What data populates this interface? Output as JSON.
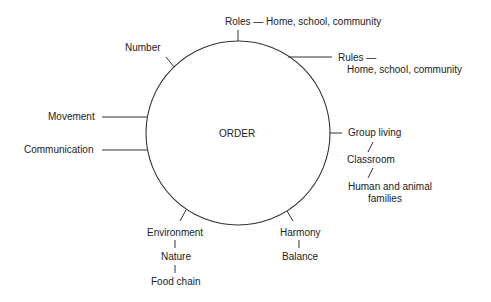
{
  "diagram": {
    "center_label": "ORDER",
    "nodes": {
      "roles": "Roles — Home, school, community",
      "number": "Number",
      "rules_line1": "Rules —",
      "rules_line2": "Home, school, community",
      "movement": "Movement",
      "communication": "Communication",
      "group_living": "Group living",
      "classroom": "Classroom",
      "human_families_line1": "Human and animal",
      "human_families_line2": "families",
      "environment": "Environment",
      "nature": "Nature",
      "food_chain": "Food chain",
      "harmony": "Harmony",
      "balance": "Balance"
    },
    "line_color": "#333333",
    "circle": {
      "cx": 238,
      "cy": 133,
      "r": 92
    }
  }
}
